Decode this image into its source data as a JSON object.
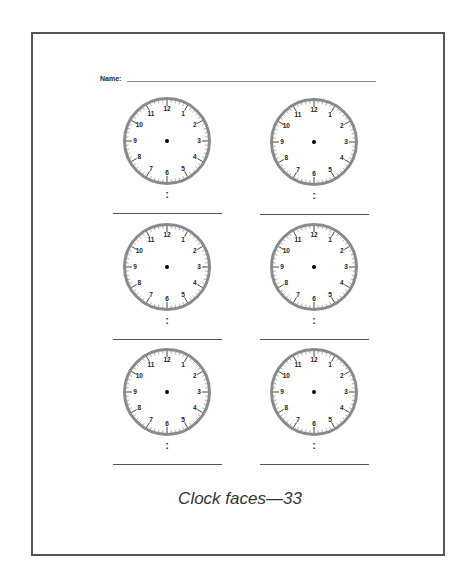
{
  "worksheet": {
    "name_label": "Name:",
    "caption": "Clock faces—33",
    "colors": {
      "border": "#555555",
      "ring": "#8a8a8a",
      "text": "#222222"
    },
    "clock_numerals": [
      "12",
      "1",
      "2",
      "3",
      "4",
      "5",
      "6",
      "7",
      "8",
      "9",
      "10",
      "11"
    ],
    "clocks": [
      {
        "id": 1,
        "cx": 167,
        "cy": 141,
        "colon": ":",
        "answer": ""
      },
      {
        "id": 2,
        "cx": 314,
        "cy": 142,
        "colon": ":",
        "answer": ""
      },
      {
        "id": 3,
        "cx": 167,
        "cy": 267,
        "colon": ":",
        "answer": ""
      },
      {
        "id": 4,
        "cx": 314,
        "cy": 267,
        "colon": ":",
        "answer": ""
      },
      {
        "id": 5,
        "cx": 167,
        "cy": 392,
        "colon": ":",
        "answer": ""
      },
      {
        "id": 6,
        "cx": 314,
        "cy": 392,
        "colon": ":",
        "answer": ""
      }
    ]
  }
}
